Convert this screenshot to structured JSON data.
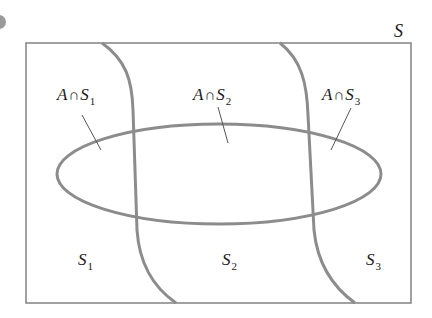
{
  "diagram": {
    "type": "venn-partition",
    "colors": {
      "frame": "#8a8a8a",
      "curves": "#8c8c8c",
      "ellipse": "#8c8c8c",
      "leader": "#555555",
      "text": "#1a1a1a"
    },
    "universe": {
      "label": "S",
      "x": 26,
      "y": 43,
      "width": 385,
      "height": 260
    },
    "event_A": {
      "name": "A",
      "cx": 219,
      "cy": 174,
      "rx": 162,
      "ry": 50
    },
    "partitions": [
      {
        "name": "S",
        "sub": "1",
        "label_x": 78,
        "label_y": 252
      },
      {
        "name": "S",
        "sub": "2",
        "label_x": 222,
        "label_y": 252
      },
      {
        "name": "S",
        "sub": "3",
        "label_x": 366,
        "label_y": 252
      }
    ],
    "intersections": [
      {
        "left": "A",
        "op": "∩",
        "set": "S",
        "sub": "1",
        "label_x": 57,
        "label_y": 86,
        "leader": {
          "x1": 82,
          "y1": 115,
          "x2": 101,
          "y2": 150
        }
      },
      {
        "left": "A",
        "op": "∩",
        "set": "S",
        "sub": "2",
        "label_x": 193,
        "label_y": 86,
        "leader": {
          "x1": 218,
          "y1": 107,
          "x2": 228,
          "y2": 143
        }
      },
      {
        "left": "A",
        "op": "∩",
        "set": "S",
        "sub": "3",
        "label_x": 322,
        "label_y": 86,
        "leader": {
          "x1": 351,
          "y1": 108,
          "x2": 331,
          "y2": 150
        }
      }
    ],
    "dividers": [
      {
        "name": "divider-1",
        "path": "M 102 43 C 126 60, 132 80, 133 110 L 137 230 C 139 260, 150 285, 176 303"
      },
      {
        "name": "divider-2",
        "path": "M 280 43 C 302 60, 307 85, 308 115 L 314 230 C 317 260, 330 285, 355 303"
      }
    ]
  }
}
